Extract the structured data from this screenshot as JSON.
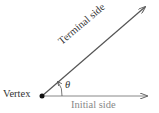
{
  "diagram": {
    "labels": {
      "vertex": "Vertex",
      "terminal_side": "Terminal side",
      "initial_side": "Initial side",
      "angle": "θ"
    },
    "colors": {
      "lines": "#555555",
      "initial_label": "#888888",
      "text": "#333333"
    }
  }
}
